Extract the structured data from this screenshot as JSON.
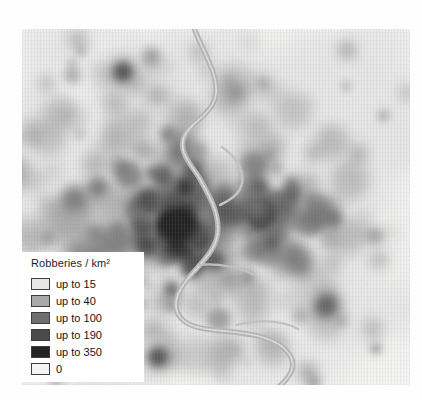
{
  "figure": {
    "kind": "choropleth-density-map",
    "background_color": "#ffffff",
    "map_background_color": "#f3f3f2"
  },
  "map": {
    "river_color": "#b6b6b6",
    "river_name": "river-channel"
  },
  "legend": {
    "title": "Robberies / km²",
    "background_color": "#ffffff",
    "border_color": "#3d3d3d",
    "items": [
      {
        "label": "up to 15",
        "color": "#e6e6e6"
      },
      {
        "label": "up to 40",
        "color": "#a8a8a8"
      },
      {
        "label": "up to 100",
        "color": "#6f6f6f"
      },
      {
        "label": "up to 190",
        "color": "#4a4a4a"
      },
      {
        "label": "up to 350",
        "color": "#232323"
      },
      {
        "label": "0",
        "color": "#f4f4f4"
      }
    ]
  },
  "chart_data": {
    "type": "heatmap",
    "title": "Robberies / km²",
    "xlabel": "",
    "ylabel": "",
    "legend_position": "bottom-left",
    "grid": false,
    "class_breaks": [
      0,
      15,
      40,
      100,
      190,
      350
    ],
    "class_labels": [
      "0",
      "up to 15",
      "up to 40",
      "up to 100",
      "up to 190",
      "up to 350"
    ],
    "class_colors": [
      "#f4f4f4",
      "#e6e6e6",
      "#a8a8a8",
      "#6f6f6f",
      "#4a4a4a",
      "#232323"
    ],
    "units": "robberies per square kilometre",
    "annotations": [
      "river channel running north-south through the map"
    ],
    "hotspots": [
      {
        "x": 0.38,
        "y": 0.55,
        "class": "up to 350",
        "note": "city centre core"
      },
      {
        "x": 0.32,
        "y": 0.48,
        "class": "up to 190"
      },
      {
        "x": 0.46,
        "y": 0.6,
        "class": "up to 190"
      },
      {
        "x": 0.6,
        "y": 0.5,
        "class": "up to 100"
      },
      {
        "x": 0.26,
        "y": 0.12,
        "class": "up to 190"
      },
      {
        "x": 0.78,
        "y": 0.78,
        "class": "up to 100"
      },
      {
        "x": 0.35,
        "y": 0.92,
        "class": "up to 190"
      }
    ]
  }
}
